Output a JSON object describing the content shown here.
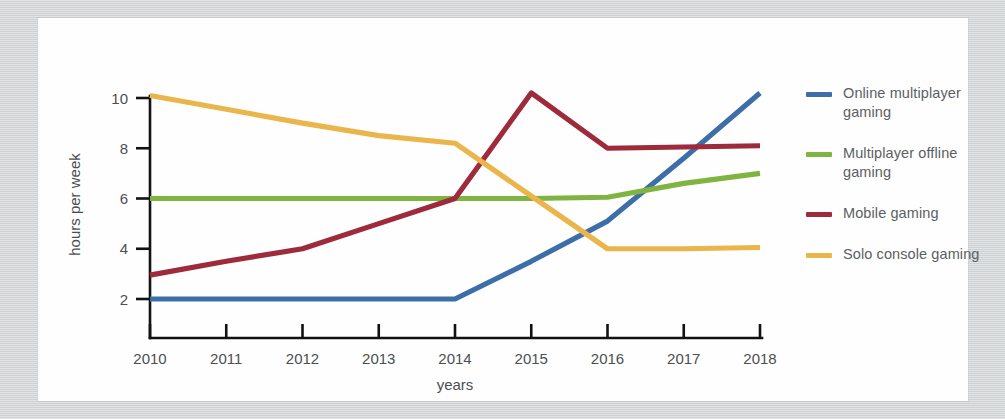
{
  "chart_data": {
    "type": "line",
    "title": "",
    "xlabel": "years",
    "ylabel": "hours per week",
    "categories": [
      "2010",
      "2011",
      "2012",
      "2013",
      "2014",
      "2015",
      "2016",
      "2017",
      "2018"
    ],
    "x": [
      2010,
      2011,
      2012,
      2013,
      2014,
      2015,
      2016,
      2017,
      2018
    ],
    "xlim": [
      2010,
      2018
    ],
    "ylim": [
      0,
      10.6
    ],
    "yticks": [
      2,
      4,
      6,
      8,
      10
    ],
    "ytick_labels": [
      "2",
      "4",
      "6",
      "8",
      "10"
    ],
    "grid": false,
    "legend_position": "right",
    "series": [
      {
        "name": "Online multiplayer gaming",
        "color": "#3d6ea8",
        "values": [
          2.0,
          2.0,
          2.0,
          2.0,
          2.0,
          3.5,
          5.1,
          7.6,
          10.2
        ]
      },
      {
        "name": "Multiplayer offline gaming",
        "color": "#80b441",
        "values": [
          6.0,
          6.0,
          6.0,
          6.0,
          6.0,
          6.0,
          6.05,
          6.6,
          7.0
        ]
      },
      {
        "name": "Mobile gaming",
        "color": "#9d2b3b",
        "values": [
          2.95,
          3.5,
          4.0,
          5.0,
          6.0,
          10.2,
          8.0,
          8.05,
          8.1
        ]
      },
      {
        "name": "Solo console gaming",
        "color": "#eab64c",
        "values": [
          10.1,
          9.55,
          9.0,
          8.5,
          8.2,
          6.1,
          4.0,
          4.0,
          4.05
        ]
      }
    ]
  },
  "legend": {
    "items": [
      {
        "label": "Online multiplayer gaming",
        "color": "#3d6ea8"
      },
      {
        "label": "Multiplayer offline gaming",
        "color": "#80b441"
      },
      {
        "label": "Mobile gaming",
        "color": "#9d2b3b"
      },
      {
        "label": "Solo console gaming",
        "color": "#eab64c"
      }
    ]
  },
  "axes": {
    "x_title": "years",
    "y_title": "hours per week",
    "x_tick_labels": [
      "2010",
      "2011",
      "2012",
      "2013",
      "2014",
      "2015",
      "2016",
      "2017",
      "2018"
    ],
    "y_tick_labels": [
      "2",
      "4",
      "6",
      "8",
      "10"
    ]
  },
  "colors": {
    "page_background": "#d2d5d7",
    "card_background": "#fefefe",
    "axis": "#111215",
    "tick_text": "#4b4f53",
    "legend_text": "#5b5f63"
  }
}
